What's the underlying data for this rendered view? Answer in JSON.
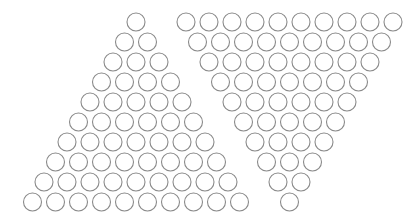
{
  "figure": {
    "width": 420,
    "height": 220,
    "background": "#ffffff",
    "stroke_color": "#8a8a8a",
    "stroke_width": 1.1,
    "radius": 9,
    "h_spacing": 23,
    "v_spacing": 20
  },
  "left_triangle": {
    "name": "upright-triangle",
    "rows": 10,
    "apex_x": 136,
    "top_y": 22,
    "counts": [
      1,
      2,
      3,
      4,
      5,
      6,
      7,
      8,
      9,
      10
    ]
  },
  "right_triangle": {
    "name": "inverted-triangle",
    "rows": 10,
    "top_left_x": 186,
    "top_y": 22,
    "counts": [
      10,
      9,
      8,
      7,
      6,
      5,
      4,
      3,
      2,
      1
    ]
  },
  "total_circles": 110
}
